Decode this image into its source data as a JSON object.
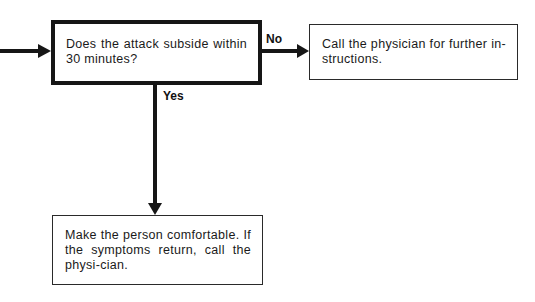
{
  "diagram": {
    "type": "flowchart",
    "nodes": {
      "decision": {
        "text": "Does the attack  subside within 30 minutes?",
        "shape": "decision-box"
      },
      "no_action": {
        "text": "Call the physician for further in-structions."
      },
      "yes_action": {
        "text": "Make the person comfortable. If the symptoms return, call the physi-cian."
      }
    },
    "edges": {
      "no_label": "No",
      "yes_label": "Yes"
    },
    "colors": {
      "stroke": "#161616",
      "background": "#ffffff"
    }
  }
}
